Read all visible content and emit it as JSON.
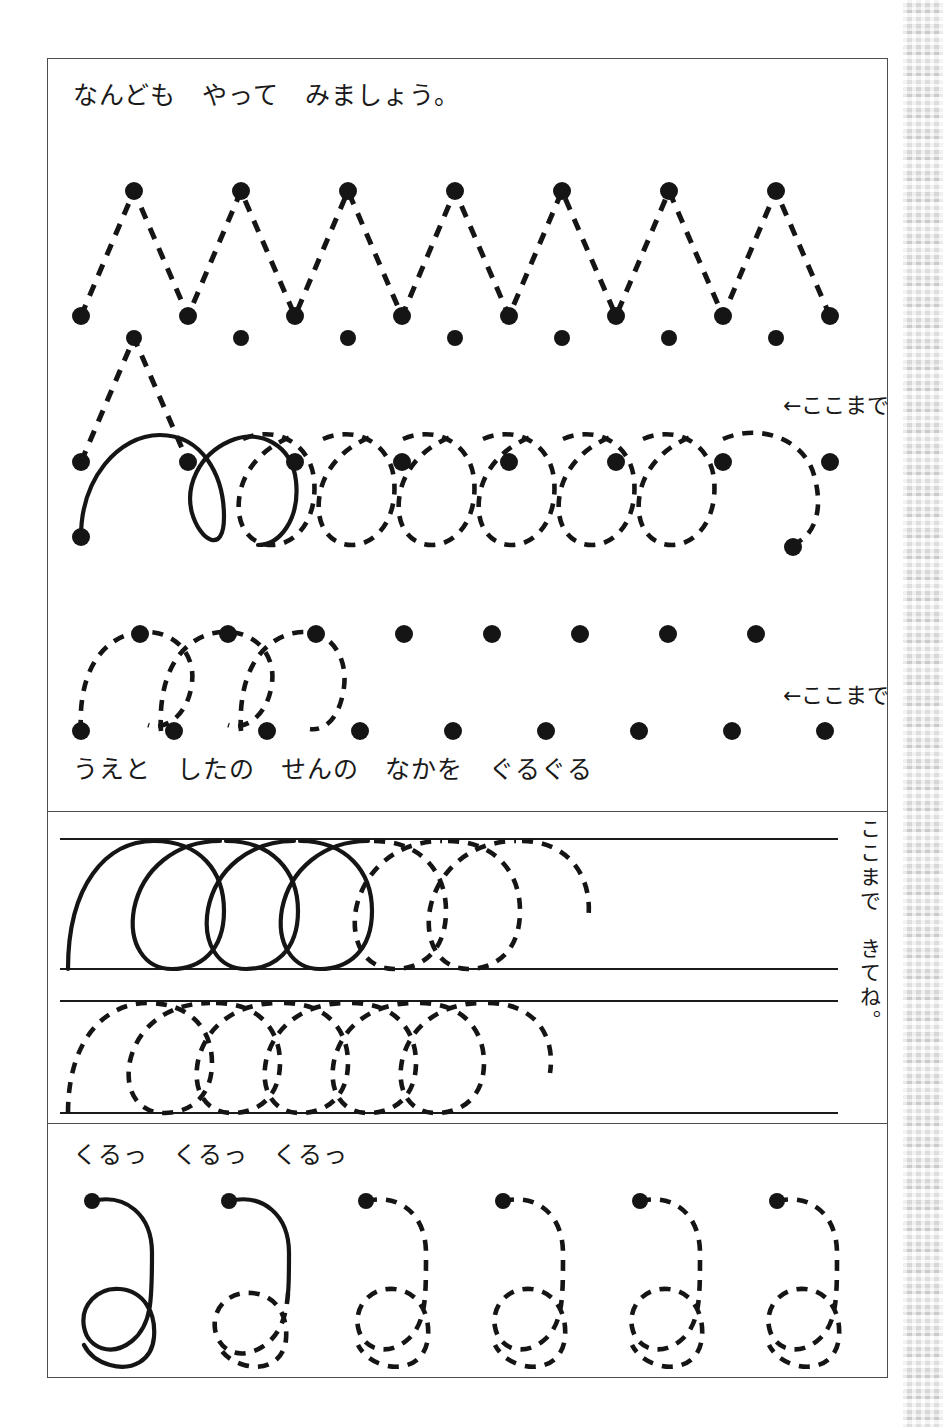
{
  "page": {
    "title_line": "なんども　やって　みましょう。",
    "instruction_line": "うえと　したの　せんの　なかを　ぐるぐる",
    "bottom_line": "くるっ　くるっ　くるっ",
    "vertical_note": "ここまで　きてね。",
    "here_label_1": "←ここまで",
    "here_label_2": "←ここまで",
    "ink_color": "#151515",
    "frame_color": "#4d4d4d",
    "paper_color": "#ffffff"
  },
  "sections": {
    "zigzag": {
      "name": "zigzag-tracing",
      "row1": {
        "dot_count_bottom": 7,
        "dot_count_peak": 6,
        "traced_peaks": 6,
        "baseline_y": 197,
        "peak_y": 72,
        "x_start": 33,
        "x_step": 107
      },
      "row2": {
        "dot_count_bottom": 8,
        "dot_count_peak": 7,
        "traced_peaks": 1,
        "baseline_y": 343,
        "peak_y": 219,
        "x_start": 33,
        "x_step": 107
      }
    },
    "loops": {
      "name": "loop-tracing",
      "row1": {
        "loop_count": 8,
        "solid_loops": 1,
        "dot_count": 2,
        "top_y": 375,
        "bottom_y": 478
      },
      "row2": {
        "loop_count": 3,
        "solid_loops": 0,
        "dot_count_top": 9,
        "dot_count_bottom": 9,
        "top_y": 540,
        "bottom_y": 637
      }
    },
    "ruled_bands": {
      "name": "ruled-loop-bands",
      "band1": {
        "top_y": 780,
        "bottom_y": 910,
        "loop_count": 5,
        "solid_loops": 3
      },
      "band2": {
        "top_y": 940,
        "bottom_y": 1053,
        "loop_count": 5,
        "solid_loops": 0
      }
    },
    "spirals": {
      "name": "spiral-tracing",
      "count": 6,
      "solid_count": 1,
      "partial_solid_index": 2,
      "x_start": 90,
      "x_step": 137,
      "center_y": 1210
    }
  }
}
